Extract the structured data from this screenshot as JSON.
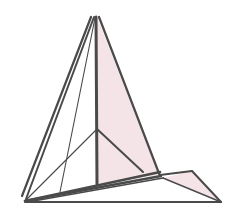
{
  "diagram": {
    "type": "folded-polyhedron-line-drawing",
    "colors": {
      "background": "#ffffff",
      "stroke": "#4a4a4a",
      "face_fill": "#f5e4e7"
    },
    "vertices": {
      "apex_left": [
        91,
        17
      ],
      "apex_mid": [
        95,
        17
      ],
      "apex_right": [
        99,
        17
      ],
      "joint": [
        97,
        129
      ],
      "vertical_base": [
        97,
        184
      ],
      "base_left": [
        25,
        201
      ],
      "base_left_outer": [
        22,
        196
      ],
      "thin_base": [
        60,
        192
      ],
      "pink_base": [
        159,
        175
      ],
      "diag_end": [
        143,
        172
      ],
      "flap_inner": [
        163,
        178
      ],
      "flap_top": [
        192,
        171
      ],
      "base_right": [
        221,
        201
      ]
    }
  }
}
